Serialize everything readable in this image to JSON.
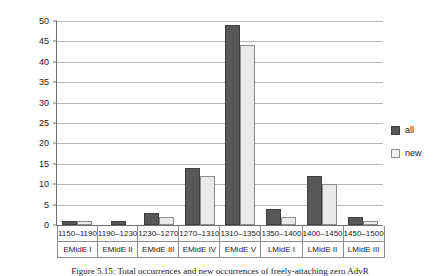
{
  "chart_data": {
    "type": "bar",
    "title": "",
    "xlabel": "",
    "ylabel": "",
    "ylim": [
      0,
      50
    ],
    "yticks": [
      0,
      5,
      10,
      15,
      20,
      25,
      30,
      35,
      40,
      45,
      50
    ],
    "grid": true,
    "legend_position": "right",
    "categories": [
      "1150–1190",
      "1190–1230",
      "1230–1270",
      "1270–1310",
      "1310–1350",
      "1350–1400",
      "1400–1450",
      "1450–1500"
    ],
    "category_phases": [
      "EMidE I",
      "EMidE II",
      "EMidE III",
      "EMidE IV",
      "EMidE V",
      "LMidE I",
      "LMidE II",
      "LMidE III"
    ],
    "series": [
      {
        "name": "all",
        "color": "#585858",
        "values": [
          1,
          1,
          3,
          14,
          49,
          4,
          12,
          2
        ]
      },
      {
        "name": "new",
        "color": "#e9e9e9",
        "values": [
          1,
          0,
          2,
          12,
          44,
          2,
          10,
          1
        ]
      }
    ]
  },
  "legend": {
    "items": [
      {
        "label": "all"
      },
      {
        "label": "new"
      }
    ]
  },
  "caption": {
    "text": "Figure 5.15: Total occurrences and new occurrences of freely-attaching zero AdvR"
  }
}
